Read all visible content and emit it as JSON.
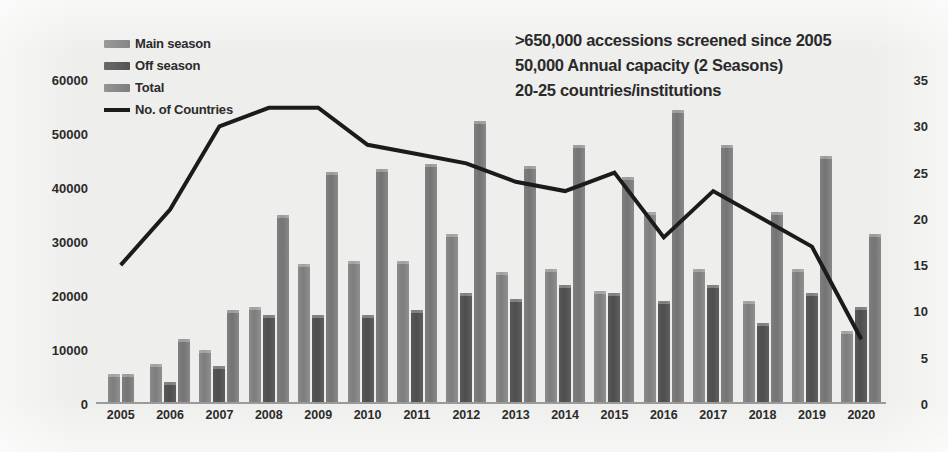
{
  "legend": {
    "items": [
      {
        "label": "Main season",
        "marker": "swatch",
        "color": "#858585"
      },
      {
        "label": "Off season",
        "marker": "swatch",
        "color": "#545454"
      },
      {
        "label": "Total",
        "marker": "swatch",
        "color": "#7d7d7d"
      },
      {
        "label": "No. of Countries",
        "marker": "line",
        "color": "#1b1b1b"
      }
    ]
  },
  "annotations": [
    ">650,000 accessions screened since 2005",
    "50,000 Annual capacity (2 Seasons)",
    "20-25 countries/institutions"
  ],
  "chart_data": {
    "type": "bar",
    "title": "",
    "subtitle": "",
    "xlabel": "",
    "ylabel": "",
    "y2label": "",
    "grid": false,
    "legend_position": "top-left",
    "categories": [
      "2005",
      "2006",
      "2007",
      "2008",
      "2009",
      "2010",
      "2011",
      "2012",
      "2013",
      "2014",
      "2015",
      "2016",
      "2017",
      "2018",
      "2019",
      "2020"
    ],
    "ylim": [
      0,
      60000
    ],
    "yticks": [
      0,
      10000,
      20000,
      30000,
      40000,
      50000,
      60000
    ],
    "ytick_labels": [
      "0",
      "10000",
      "20000",
      "30000",
      "40000",
      "50000",
      "60000"
    ],
    "y2lim": [
      0,
      35
    ],
    "y2ticks": [
      0,
      5,
      10,
      15,
      20,
      25,
      30,
      35
    ],
    "y2tick_labels": [
      "0",
      "5",
      "10",
      "15",
      "20",
      "25",
      "30",
      "35"
    ],
    "series": [
      {
        "name": "Main season",
        "axis": "left",
        "kind": "bar",
        "color": "#858585",
        "values": [
          5500,
          7500,
          10000,
          18000,
          26000,
          26500,
          26500,
          31500,
          24500,
          25000,
          21000,
          35500,
          25000,
          19000,
          25000,
          13500
        ]
      },
      {
        "name": "Off season",
        "axis": "left",
        "kind": "bar",
        "color": "#545454",
        "values": [
          0,
          4000,
          7000,
          16500,
          16500,
          16500,
          17500,
          20500,
          19500,
          22000,
          20500,
          19000,
          22000,
          15000,
          20500,
          18000
        ]
      },
      {
        "name": "Total",
        "axis": "left",
        "kind": "bar",
        "color": "#7d7d7d",
        "values": [
          5500,
          12000,
          17500,
          35000,
          43000,
          43500,
          44500,
          52500,
          44000,
          48000,
          42000,
          54500,
          48000,
          35500,
          46000,
          31500
        ]
      },
      {
        "name": "No. of Countries",
        "axis": "right",
        "kind": "line",
        "color": "#1b1b1b",
        "values": [
          15,
          21,
          30,
          32,
          32,
          28,
          27,
          26,
          24,
          23,
          25,
          18,
          23,
          20,
          17,
          7
        ]
      }
    ]
  }
}
